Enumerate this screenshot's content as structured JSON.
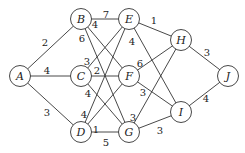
{
  "diagram": {
    "type": "weighted-undirected-graph",
    "colors": {
      "stroke": "#333333",
      "text": "#222222",
      "background": "#ffffff"
    },
    "nodes": [
      {
        "id": "A",
        "label": "A",
        "x": 20,
        "y": 76
      },
      {
        "id": "B",
        "label": "B",
        "x": 81,
        "y": 19
      },
      {
        "id": "C",
        "label": "C",
        "x": 81,
        "y": 76
      },
      {
        "id": "D",
        "label": "D",
        "x": 81,
        "y": 132
      },
      {
        "id": "E",
        "label": "E",
        "x": 129,
        "y": 19
      },
      {
        "id": "F",
        "label": "F",
        "x": 129,
        "y": 76
      },
      {
        "id": "G",
        "label": "G",
        "x": 129,
        "y": 132
      },
      {
        "id": "H",
        "label": "H",
        "x": 181,
        "y": 40
      },
      {
        "id": "I",
        "label": "I",
        "x": 181,
        "y": 112
      },
      {
        "id": "J",
        "label": "J",
        "x": 228,
        "y": 76
      }
    ],
    "edges": [
      {
        "from": "A",
        "to": "B",
        "weight": "2",
        "lx": 45,
        "ly": 42
      },
      {
        "from": "A",
        "to": "C",
        "weight": "4",
        "lx": 47,
        "ly": 70
      },
      {
        "from": "A",
        "to": "D",
        "weight": "3",
        "lx": 47,
        "ly": 112
      },
      {
        "from": "B",
        "to": "E",
        "weight": "7",
        "lx": 106,
        "ly": 14
      },
      {
        "from": "B",
        "to": "F",
        "weight": "4",
        "lx": 95,
        "ly": 24
      },
      {
        "from": "B",
        "to": "G",
        "weight": "6",
        "lx": 82,
        "ly": 38
      },
      {
        "from": "C",
        "to": "E",
        "weight": "3",
        "lx": 87,
        "ly": 61
      },
      {
        "from": "C",
        "to": "F",
        "weight": "2",
        "lx": 97,
        "ly": 70
      },
      {
        "from": "C",
        "to": "G",
        "weight": "4",
        "lx": 88,
        "ly": 93
      },
      {
        "from": "D",
        "to": "E",
        "weight": "4",
        "lx": 84,
        "ly": 114
      },
      {
        "from": "D",
        "to": "F",
        "weight": "1",
        "lx": 96,
        "ly": 129
      },
      {
        "from": "D",
        "to": "G",
        "weight": "5",
        "lx": 106,
        "ly": 142
      },
      {
        "from": "E",
        "to": "H",
        "weight": "1",
        "lx": 154,
        "ly": 20
      },
      {
        "from": "E",
        "to": "I",
        "weight": "4",
        "lx": 132,
        "ly": 41
      },
      {
        "from": "F",
        "to": "H",
        "weight": "6",
        "lx": 140,
        "ly": 63
      },
      {
        "from": "F",
        "to": "I",
        "weight": "3",
        "lx": 143,
        "ly": 92
      },
      {
        "from": "G",
        "to": "H",
        "weight": "3",
        "lx": 133,
        "ly": 117
      },
      {
        "from": "G",
        "to": "I",
        "weight": "3",
        "lx": 160,
        "ly": 130
      },
      {
        "from": "H",
        "to": "J",
        "weight": "3",
        "lx": 207,
        "ly": 52
      },
      {
        "from": "I",
        "to": "J",
        "weight": "4",
        "lx": 206,
        "ly": 98
      }
    ]
  }
}
